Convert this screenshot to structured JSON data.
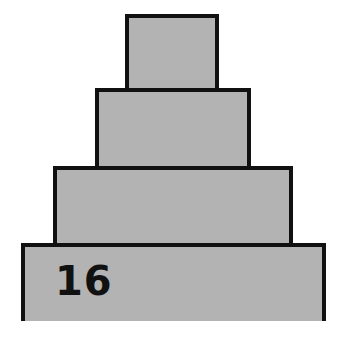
{
  "diagram": {
    "type": "stacked-tiers",
    "colors": {
      "fill": "#b3b3b3",
      "stroke": "#111111",
      "background": "#ffffff"
    },
    "tiers": [
      {
        "position": "top",
        "label": ""
      },
      {
        "position": "second",
        "label": ""
      },
      {
        "position": "third",
        "label": ""
      },
      {
        "position": "bottom",
        "label": "16"
      }
    ]
  }
}
